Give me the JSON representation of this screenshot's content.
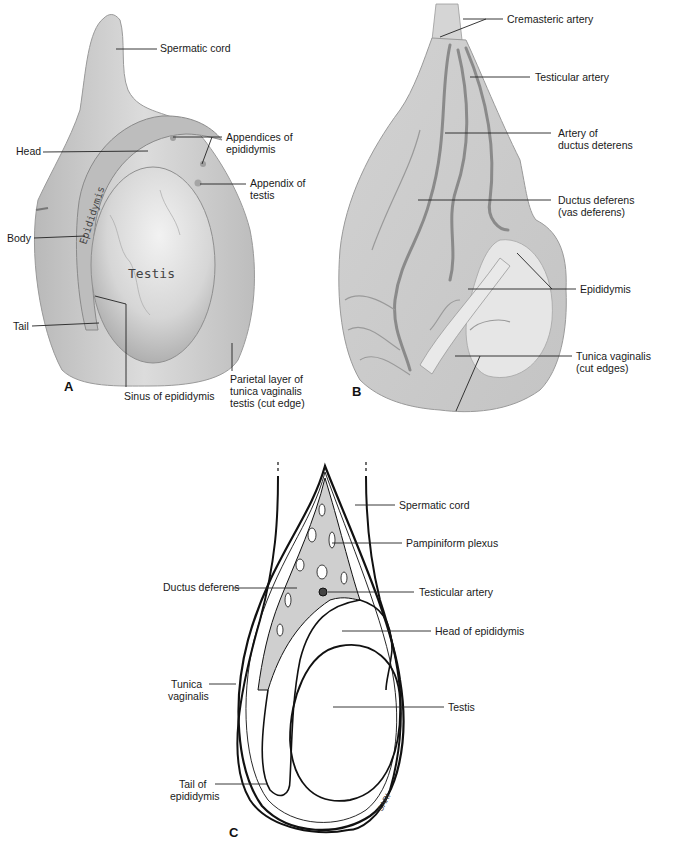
{
  "panels": {
    "A": {
      "letter": "A",
      "labels": {
        "spermatic_cord": "Spermatic cord",
        "head": "Head",
        "appendices_1": "Appendices of",
        "appendices_2": "epididymis",
        "appendix_1": "Appendix of",
        "appendix_2": "testis",
        "body": "Body",
        "tail": "Tail",
        "sinus": "Sinus of epididymis",
        "parietal_1": "Parietal layer of",
        "parietal_2": "tunica vaginalis",
        "parietal_3": "testis (cut edge)",
        "inline_epididymis": "Epididymis",
        "inline_testis": "Testis"
      }
    },
    "B": {
      "letter": "B",
      "labels": {
        "cremasteric": "Cremasteric artery",
        "testicular": "Testicular artery",
        "artery_dd_1": "Artery of",
        "artery_dd_2": "ductus deterens",
        "ductus_1": "Ductus deferens",
        "ductus_2": "(vas deferens)",
        "epididymis": "Epididymis",
        "tunica_1": "Tunica vaginalis",
        "tunica_2": "(cut edges)"
      }
    },
    "C": {
      "letter": "C",
      "labels": {
        "spermatic_cord": "Spermatic cord",
        "pampiniform": "Pampiniform plexus",
        "ductus_deferens": "Ductus deferens",
        "testicular_artery": "Testicular artery",
        "head_epididymis": "Head of epididymis",
        "tunica_1": "Tunica",
        "tunica_2": "vaginalis",
        "testis": "Testis",
        "tail_1": "Tail of",
        "tail_2": "epididymis",
        "signature": "SARI"
      }
    }
  },
  "colors": {
    "tissue_light": "#e4e4e4",
    "tissue_mid": "#c9c9c9",
    "tissue_dark": "#9a9a9a",
    "vessel": "#8a8a8a",
    "plexus": "#cfcfcf",
    "line": "#111111"
  }
}
